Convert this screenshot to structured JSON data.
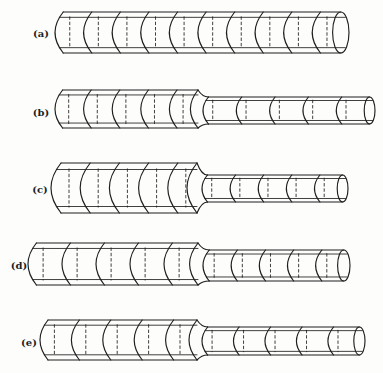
{
  "figure": {
    "background": "#fdfdfc",
    "ink": "#1f1f1f",
    "kind": "stepped-shaft-segment-diagram",
    "rows": [
      {
        "label": "(a)",
        "label_x": 41,
        "label_y": 33,
        "sections": [
          {
            "name": "uniform",
            "x1": 55,
            "x2": 349,
            "y_top": 12,
            "y_bottom": 53,
            "segments": 10
          }
        ]
      },
      {
        "label": "(b)",
        "label_x": 41,
        "label_y": 112,
        "sections": [
          {
            "name": "thick",
            "x1": 55,
            "x2": 198,
            "y_top": 90,
            "y_bottom": 128,
            "segments": 5
          },
          {
            "name": "thin",
            "x1": 198,
            "x2": 375,
            "y_top": 97,
            "y_bottom": 124,
            "segments": 5
          }
        ]
      },
      {
        "label": "(c)",
        "label_x": 40,
        "label_y": 189,
        "sections": [
          {
            "name": "thick",
            "x1": 51,
            "x2": 197,
            "y_top": 163,
            "y_bottom": 213,
            "segments": 5
          },
          {
            "name": "thin",
            "x1": 197,
            "x2": 348,
            "y_top": 175,
            "y_bottom": 202,
            "segments": 5
          }
        ]
      },
      {
        "label": "(d)",
        "label_x": 19,
        "label_y": 265,
        "sections": [
          {
            "name": "thick",
            "x1": 28,
            "x2": 198,
            "y_top": 243,
            "y_bottom": 285,
            "segments": 5
          },
          {
            "name": "thin",
            "x1": 198,
            "x2": 350,
            "y_top": 250,
            "y_bottom": 281,
            "segments": 5
          }
        ]
      },
      {
        "label": "(e)",
        "label_x": 29,
        "label_y": 342,
        "sections": [
          {
            "name": "thick",
            "x1": 40,
            "x2": 197,
            "y_top": 320,
            "y_bottom": 360,
            "segments": 5
          },
          {
            "name": "thin",
            "x1": 197,
            "x2": 365,
            "y_top": 327,
            "y_bottom": 355,
            "segments": 5
          }
        ]
      }
    ]
  }
}
